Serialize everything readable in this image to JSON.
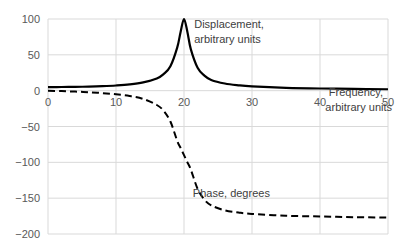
{
  "chart_data": {
    "type": "line",
    "title": "",
    "xlabel": "Frequency, arbitrary units",
    "ylabel": "",
    "xlim": [
      0,
      50
    ],
    "ylim": [
      -200,
      100
    ],
    "x_ticks": [
      0,
      10,
      20,
      30,
      40,
      50
    ],
    "y_ticks": [
      100,
      50,
      0,
      -50,
      -100,
      -150,
      -200
    ],
    "x_tick_labels": [
      "0",
      "10",
      "20",
      "30",
      "40",
      "50"
    ],
    "y_tick_labels": [
      "100",
      "50",
      "0",
      "−50",
      "−100",
      "−150",
      "−200"
    ],
    "grid": true,
    "legend": "none",
    "x": [
      0,
      2,
      4,
      6,
      8,
      10,
      12,
      14,
      16,
      17,
      18,
      19,
      19.5,
      20,
      20.5,
      21,
      22,
      23,
      24,
      26,
      28,
      30,
      35,
      40,
      45,
      50
    ],
    "series": [
      {
        "name": "Displacement, arbitrary units",
        "style": "solid",
        "color": "#000000",
        "values": [
          5,
          5.1,
          5.3,
          5.7,
          6.3,
          7.2,
          8.7,
          11.5,
          17,
          23,
          34,
          60,
          82,
          100,
          82,
          58,
          32,
          21,
          15,
          10,
          7.5,
          6,
          4,
          3,
          2.5,
          2
        ]
      },
      {
        "name": "Phase, degrees",
        "style": "dashed",
        "color": "#000000",
        "values": [
          0,
          -0.6,
          -1.3,
          -2.2,
          -3.4,
          -5,
          -7.5,
          -11.5,
          -20,
          -28,
          -43,
          -70,
          -80,
          -90,
          -100,
          -110,
          -137,
          -152,
          -160,
          -167,
          -170,
          -172,
          -174.5,
          -175.5,
          -176.5,
          -177
        ]
      }
    ],
    "annotations": [
      {
        "text_lines": [
          "Displacement,",
          "arbitrary units"
        ],
        "x": 21.5,
        "y": 88
      },
      {
        "text_lines": [
          "Frequency,",
          "arbitrary units"
        ],
        "x": 41,
        "y": -8
      },
      {
        "text_lines": [
          "Phase, degrees"
        ],
        "x": 21.3,
        "y": -148
      }
    ]
  }
}
